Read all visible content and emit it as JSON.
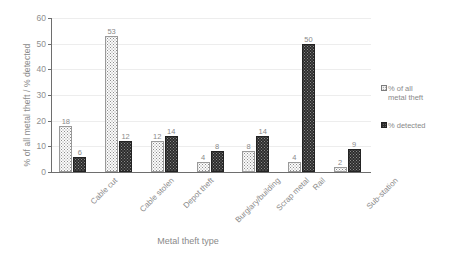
{
  "chart_data": {
    "type": "bar",
    "title": "",
    "xlabel": "Metal theft type",
    "ylabel": "% of all metal theft / % detected",
    "categories": [
      "Cable cut",
      "Cable stolen",
      "Depot theft",
      "Burglary/building",
      "Scrap metal",
      "Rail",
      "Sub-station"
    ],
    "series": [
      {
        "name": "% of all metal theft",
        "values": [
          18,
          53,
          12,
          4,
          8,
          4,
          2
        ]
      },
      {
        "name": "% detected",
        "values": [
          6,
          12,
          14,
          8,
          14,
          50,
          9
        ]
      }
    ],
    "ylim": [
      0,
      60
    ],
    "yticks": [
      0,
      10,
      20,
      30,
      40,
      50,
      60
    ],
    "grid": true,
    "legend_position": "right",
    "colors": {
      "series_0_fill": "#fbfbfb",
      "series_0_border": "#9a9a9a",
      "series_1_fill": "#2c2c2c",
      "series_1_border": "#232323",
      "axis": "#6e6e6e",
      "grid": "#ededed",
      "text": "#8a8a8a"
    }
  },
  "legend": {
    "items": [
      {
        "label": "% of all\nmetal theft",
        "swatch": "series-0-swatch-icon"
      },
      {
        "label": "% detected",
        "swatch": "series-1-swatch-icon"
      }
    ]
  }
}
